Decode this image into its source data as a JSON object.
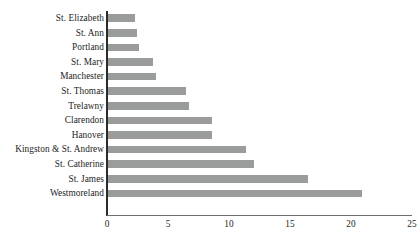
{
  "chart_data": {
    "type": "bar",
    "orientation": "horizontal",
    "title": "",
    "xlabel": "",
    "ylabel": "",
    "xlim": [
      0,
      25
    ],
    "xticks": [
      "0",
      "5",
      "10",
      "15",
      "20",
      "25"
    ],
    "grid": false,
    "legend": null,
    "bar_color": "#9a9b9b",
    "axis_color": "#2b2b2b",
    "text_color": "#1d1d1d",
    "categories": [
      "St. Elizabeth",
      "St. Ann",
      "Portland",
      "St. Mary",
      "Manchester",
      "St. Thomas",
      "Trelawny",
      "Clarendon",
      "Hanover",
      "Kingston & St. Andrew",
      "St. Catherine",
      "St. James",
      "Westmoreland"
    ],
    "values": [
      2.2,
      2.4,
      2.5,
      3.7,
      3.9,
      6.4,
      6.6,
      8.5,
      8.5,
      11.3,
      12.0,
      16.4,
      20.8
    ]
  }
}
